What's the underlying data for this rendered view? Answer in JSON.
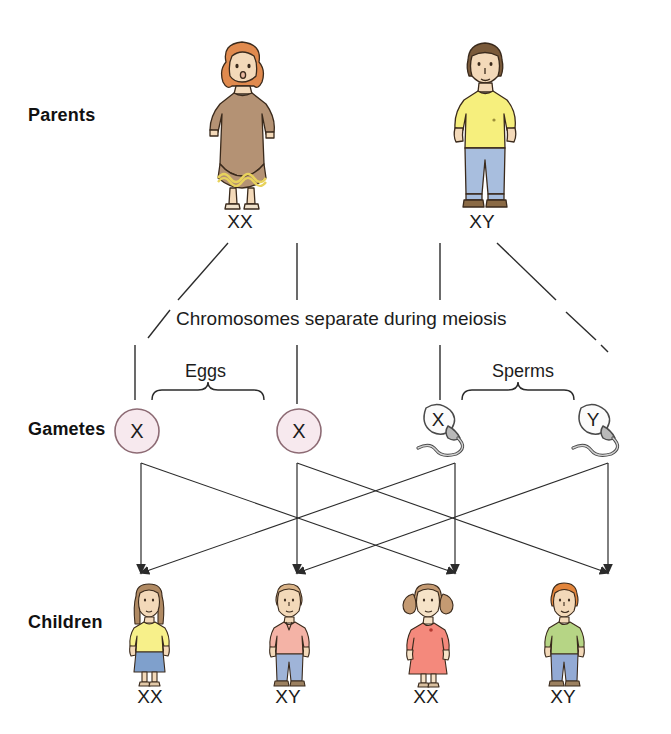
{
  "diagram": {
    "background": "#ffffff",
    "line_color": "#2b2b2b"
  },
  "rows": {
    "parents_label": "Parents",
    "gametes_label": "Gametes",
    "children_label": "Children"
  },
  "captions": {
    "meiosis": "Chromosomes separate during meiosis",
    "eggs": "Eggs",
    "sperms": "Sperms"
  },
  "parents": [
    {
      "role": "mother",
      "genotype": "XX",
      "hair_color": "#e08a4e",
      "clothing_color": "#b49274",
      "trim_color": "#e8d25c",
      "skin_color": "#f3d9b9"
    },
    {
      "role": "father",
      "genotype": "XY",
      "hair_color": "#7a5a3a",
      "clothing_color": "#f6ef7d",
      "trousers_color": "#a8bede",
      "skin_color": "#f3d9b9"
    }
  ],
  "gametes": [
    {
      "type": "egg",
      "chromosome": "X",
      "fill": "#f7e9ee",
      "stroke": "#8d6b74"
    },
    {
      "type": "egg",
      "chromosome": "X",
      "fill": "#f7e9ee",
      "stroke": "#8d6b74"
    },
    {
      "type": "sperm",
      "chromosome": "X",
      "fill": "#fbfbfb",
      "stroke": "#4a4a4a"
    },
    {
      "type": "sperm",
      "chromosome": "Y",
      "fill": "#fbfbfb",
      "stroke": "#4a4a4a"
    }
  ],
  "children": [
    {
      "genotype": "XX",
      "sex": "girl",
      "hair_color": "#b08a63",
      "top_color": "#f7f08a",
      "bottom_color": "#7fa0cc"
    },
    {
      "genotype": "XY",
      "sex": "boy",
      "hair_color": "#d9b388",
      "top_color": "#f4b3a6",
      "bottom_color": "#9fb4d8"
    },
    {
      "genotype": "XX",
      "sex": "girl",
      "hair_color": "#c49a72",
      "top_color": "#f4897c",
      "bottom_color": "#f4897c"
    },
    {
      "genotype": "XY",
      "sex": "boy",
      "hair_color": "#e2853c",
      "top_color": "#b6d585",
      "bottom_color": "#93aad4"
    }
  ],
  "positions": {
    "parent_x": [
      240,
      482
    ],
    "gamete_x": [
      135,
      297,
      440,
      595
    ],
    "child_x": [
      150,
      288,
      425,
      563
    ],
    "parent_genotype_y": 222,
    "child_genotype_y": 697
  }
}
